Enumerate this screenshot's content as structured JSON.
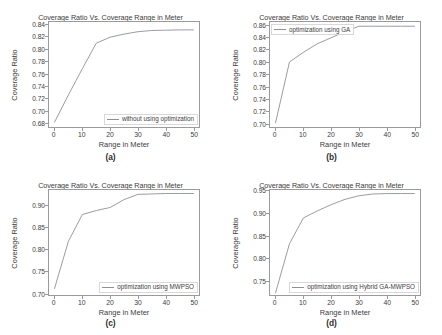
{
  "figure": {
    "background": "#ffffff",
    "line_color": "#8a8f99",
    "axis_color": "#9a9a9a"
  },
  "common": {
    "title": "Coverage Ratio Vs. Coverage Range in Meter",
    "xlabel": "Range in Meter",
    "ylabel": "Coverage Ratio",
    "xticks": [
      "0",
      "10",
      "20",
      "30",
      "40",
      "50"
    ]
  },
  "panels": [
    {
      "id": "a",
      "caption": "(a)",
      "title": "Coverage Ratio Vs. Coverage Range in Meter",
      "xlabel": "Range in Meter",
      "ylabel": "Coverage Ratio",
      "legend": "without using optimization",
      "legend_position": "bottom-right",
      "yticks": [
        "0.68",
        "0.70",
        "0.72",
        "0.74",
        "0.76",
        "0.78",
        "0.80",
        "0.82",
        "0.84"
      ]
    },
    {
      "id": "b",
      "caption": "(b)",
      "title": "Coverage Ratio Vs. Coverage Range in Meter",
      "xlabel": "Range in Meter",
      "ylabel": "Coverage Ratio",
      "legend": "optimization using GA",
      "legend_position": "top-left",
      "yticks": [
        "0.70",
        "0.72",
        "0.74",
        "0.76",
        "0.78",
        "0.80",
        "0.82",
        "0.84",
        "0.86"
      ]
    },
    {
      "id": "c",
      "caption": "(c)",
      "title": "Coverage Ratio Vs. Coverage Range in Meter",
      "xlabel": "Range in Meter",
      "ylabel": "Coverage Ratio",
      "legend": "optimization using MWPSO",
      "legend_position": "bottom-right",
      "yticks": [
        "0.70",
        "0.75",
        "0.80",
        "0.85",
        "0.90"
      ]
    },
    {
      "id": "d",
      "caption": "(d)",
      "title": "Coverage Ratio Vs. Coverage Range in Meter",
      "xlabel": "Range in Meter",
      "ylabel": "Coverage Ratio",
      "legend": "optimization using Hybrid GA-MWPSO",
      "legend_position": "bottom-right",
      "yticks": [
        "0.75",
        "0.80",
        "0.85",
        "0.90",
        "0.95"
      ]
    }
  ],
  "chart_data": [
    {
      "type": "line",
      "panel": "a",
      "title": "Coverage Ratio Vs. Coverage Range in Meter",
      "xlabel": "Range in Meter",
      "ylabel": "Coverage Ratio",
      "legend": [
        "without using optimization"
      ],
      "legend_position": "lower right",
      "grid": false,
      "xlim": [
        -2,
        52
      ],
      "ylim": [
        0.672,
        0.845
      ],
      "xticks": [
        0,
        10,
        20,
        30,
        40,
        50
      ],
      "yticks": [
        0.68,
        0.7,
        0.72,
        0.74,
        0.76,
        0.78,
        0.8,
        0.82,
        0.84
      ],
      "series": [
        {
          "name": "without using optimization",
          "x": [
            0,
            5,
            10,
            15,
            20,
            25,
            30,
            35,
            40,
            45,
            50
          ],
          "y": [
            0.68,
            0.725,
            0.768,
            0.81,
            0.82,
            0.825,
            0.829,
            0.831,
            0.8315,
            0.832,
            0.832
          ]
        }
      ]
    },
    {
      "type": "line",
      "panel": "b",
      "title": "Coverage Ratio Vs. Coverage Range in Meter",
      "xlabel": "Range in Meter",
      "ylabel": "Coverage Ratio",
      "legend": [
        "optimization using GA"
      ],
      "legend_position": "upper left",
      "grid": false,
      "xlim": [
        -2,
        52
      ],
      "ylim": [
        0.693,
        0.866
      ],
      "xticks": [
        0,
        10,
        20,
        30,
        40,
        50
      ],
      "yticks": [
        0.7,
        0.72,
        0.74,
        0.76,
        0.78,
        0.8,
        0.82,
        0.84,
        0.86
      ],
      "series": [
        {
          "name": "optimization using GA",
          "x": [
            0,
            5,
            10,
            15,
            20,
            25,
            30,
            35,
            40,
            45,
            50
          ],
          "y": [
            0.7,
            0.8,
            0.816,
            0.83,
            0.84,
            0.85,
            0.859,
            0.859,
            0.859,
            0.859,
            0.859
          ]
        }
      ]
    },
    {
      "type": "line",
      "panel": "c",
      "title": "Coverage Ratio Vs. Coverage Range in Meter",
      "xlabel": "Range in Meter",
      "ylabel": "Coverage Ratio",
      "legend": [
        "optimization using MWPSO"
      ],
      "legend_position": "lower right",
      "grid": false,
      "xlim": [
        -2,
        52
      ],
      "ylim": [
        0.695,
        0.935
      ],
      "xticks": [
        0,
        10,
        20,
        30,
        40,
        50
      ],
      "yticks": [
        0.7,
        0.75,
        0.8,
        0.85,
        0.9
      ],
      "series": [
        {
          "name": "optimization using MWPSO",
          "x": [
            0,
            5,
            10,
            15,
            20,
            25,
            30,
            35,
            40,
            45,
            50
          ],
          "y": [
            0.71,
            0.818,
            0.879,
            0.888,
            0.895,
            0.913,
            0.925,
            0.926,
            0.927,
            0.927,
            0.927
          ]
        }
      ]
    },
    {
      "type": "line",
      "panel": "d",
      "title": "Coverage Ratio Vs. Coverage Range in Meter",
      "xlabel": "Range in Meter",
      "ylabel": "Coverage Ratio",
      "legend": [
        "optimization using Hybrid GA-MWPSO"
      ],
      "legend_position": "lower right",
      "grid": false,
      "xlim": [
        -2,
        52
      ],
      "ylim": [
        0.717,
        0.953
      ],
      "xticks": [
        0,
        10,
        20,
        30,
        40,
        50
      ],
      "yticks": [
        0.75,
        0.8,
        0.85,
        0.9,
        0.95
      ],
      "series": [
        {
          "name": "optimization using Hybrid GA-MWPSO",
          "x": [
            0,
            5,
            10,
            15,
            20,
            25,
            30,
            35,
            40,
            45,
            50
          ],
          "y": [
            0.722,
            0.832,
            0.89,
            0.906,
            0.92,
            0.932,
            0.94,
            0.944,
            0.945,
            0.945,
            0.945
          ]
        }
      ]
    }
  ]
}
